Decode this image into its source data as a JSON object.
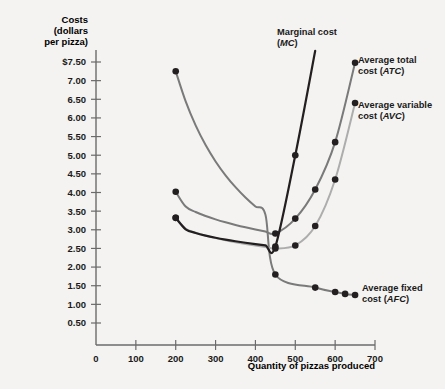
{
  "chart_data": {
    "type": "line",
    "title": "",
    "ylabel": "Costs (dollars per pizza)",
    "ylabel_lines": [
      "Costs",
      "(dollars",
      "per pizza)"
    ],
    "xlabel": "Quantity of pizzas produced",
    "xlim": [
      0,
      700
    ],
    "ylim": [
      0,
      7.75
    ],
    "grid": false,
    "legend_position": "inline-annotations",
    "yticks": [
      0.5,
      1.0,
      1.5,
      2.0,
      2.5,
      3.0,
      3.5,
      4.0,
      4.5,
      5.0,
      5.5,
      6.0,
      6.5,
      7.0,
      7.5
    ],
    "ytick_labels": [
      "0.50",
      "1.00",
      "1.50",
      "2.00",
      "2.50",
      "3.00",
      "3.50",
      "4.00",
      "4.50",
      "5.00",
      "5.50",
      "6.00",
      "6.50",
      "7.00",
      "$7.50"
    ],
    "xticks": [
      0,
      100,
      200,
      300,
      400,
      500,
      600,
      700
    ],
    "xtick_labels": [
      "0",
      "100",
      "200",
      "300",
      "400",
      "500",
      "600",
      "700"
    ],
    "series": [
      {
        "name": "Average fixed cost (AFC)",
        "label_lines": [
          "Average fixed",
          "cost (AFC)"
        ],
        "abbr": "AFC",
        "color": "#7a7a7a",
        "x": [
          200,
          450,
          550,
          600,
          625,
          650
        ],
        "values": [
          7.25,
          1.8,
          1.45,
          1.33,
          1.28,
          1.25
        ]
      },
      {
        "name": "Average total cost (ATC)",
        "label_lines": [
          "Average total",
          "cost (ATC)"
        ],
        "abbr": "ATC",
        "color": "#7a7a7a",
        "x": [
          200,
          450,
          500,
          550,
          600,
          650
        ],
        "values": [
          4.02,
          2.9,
          3.3,
          4.08,
          5.35,
          7.48
        ]
      },
      {
        "name": "Average variable cost (AVC)",
        "label_lines": [
          "Average variable",
          "cost (AVC)"
        ],
        "abbr": "AVC",
        "color": "#adadad",
        "x": [
          200,
          450,
          500,
          550,
          600,
          650
        ],
        "values": [
          3.32,
          2.5,
          2.58,
          3.1,
          4.35,
          6.4
        ]
      },
      {
        "name": "Marginal cost (MC)",
        "label_lines": [
          "Marginal cost",
          "(MC)"
        ],
        "abbr": "MC",
        "color": "#231f20",
        "x": [
          200,
          450,
          500,
          550
        ],
        "values": [
          3.32,
          2.55,
          5.0,
          7.8
        ]
      }
    ]
  },
  "annotations": {
    "mc": {
      "lines": [
        "Marginal cost",
        "(MC)"
      ]
    },
    "atc": {
      "lines": [
        "Average total",
        "cost (ATC)"
      ]
    },
    "avc": {
      "lines": [
        "Average variable",
        "cost (AVC)"
      ]
    },
    "afc": {
      "lines": [
        "Average fixed",
        "cost (AFC)"
      ]
    }
  }
}
